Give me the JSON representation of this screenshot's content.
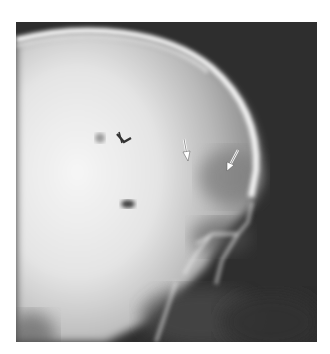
{
  "figure": {
    "kind": "lateral skull radiograph",
    "header_fragment": "",
    "background_color": "#2e2e2e",
    "bone_color": "#f2f2f2",
    "annotations": [
      {
        "type": "arrowhead",
        "label": "arrowhead",
        "color": "#3a3a3a"
      },
      {
        "type": "arrow",
        "label": "arrow-1",
        "color": "#ffffff"
      },
      {
        "type": "arrow",
        "label": "arrow-2",
        "color": "#ffffff"
      }
    ]
  }
}
